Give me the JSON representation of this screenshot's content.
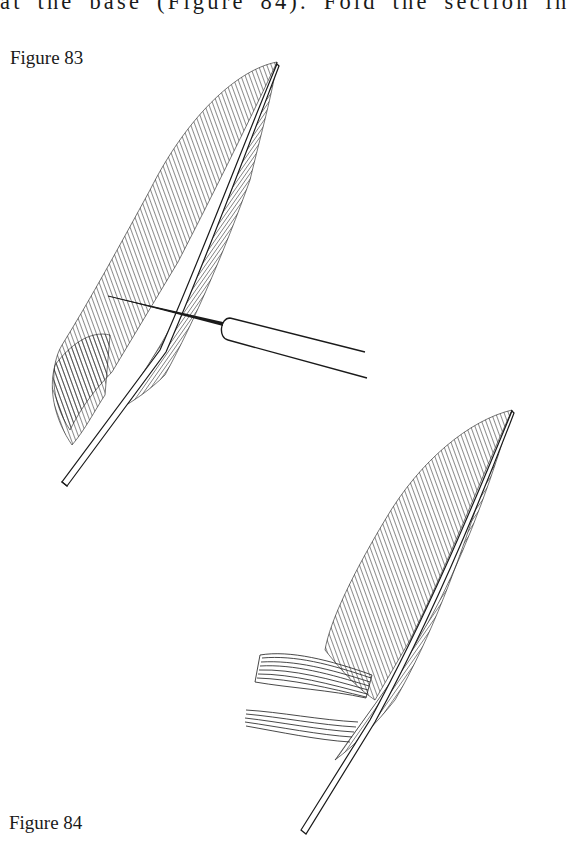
{
  "document": {
    "body_text_fragment": "at the base (Figure 84). Fold the section in",
    "figures": [
      {
        "caption": "Figure 83",
        "depicts": [
          "feather-icon",
          "needle-tool-icon"
        ],
        "description": "Feather with a dissecting needle inserted through the vane near the base"
      },
      {
        "caption": "Figure 84",
        "depicts": [
          "feather-icon"
        ],
        "description": "Feather with barbs separated into sections at the base"
      }
    ],
    "colors": {
      "ink": "#1a1a1a",
      "paper": "#ffffff"
    }
  }
}
